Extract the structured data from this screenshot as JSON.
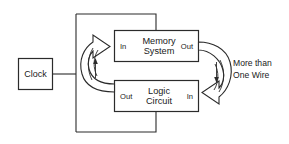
{
  "diagram": {
    "boxes": {
      "clock": {
        "label": "Clock"
      },
      "memory": {
        "line1": "Memory",
        "line2": "System",
        "port_left": "In",
        "port_right": "Out"
      },
      "logic": {
        "line1": "Logic",
        "line2": "Circuit",
        "port_left": "Out",
        "port_right": "In"
      }
    },
    "annotations": {
      "more_than_one_wire_line1": "More than",
      "more_than_one_wire_line2": "One Wire"
    },
    "colors": {
      "stroke": "#2b2b2b",
      "background": "#ffffff",
      "text": "#1a1a1a"
    }
  }
}
